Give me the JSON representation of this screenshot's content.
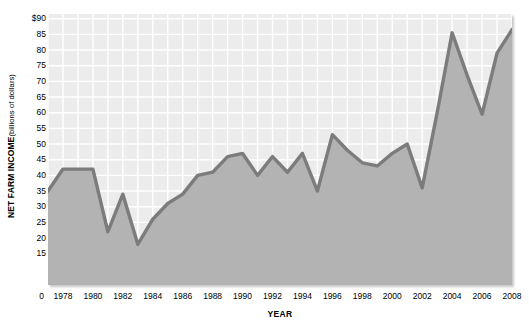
{
  "chart_data": {
    "type": "area",
    "title": "",
    "xlabel": "YEAR",
    "ylabel": "NET FARM INCOME (billions of dollars)",
    "ylabel_main": "NET FARM INCOME",
    "ylabel_sub": "(billions of dollars)",
    "ylim": [
      0,
      90
    ],
    "xlim": [
      1977,
      2008
    ],
    "grid": true,
    "legend": false,
    "legend_position": "none",
    "y_ticks": [
      90,
      85,
      80,
      75,
      70,
      65,
      60,
      55,
      50,
      45,
      40,
      35,
      30,
      25,
      20,
      15
    ],
    "y_tick_labels": [
      "$90",
      "85",
      "80",
      "75",
      "70",
      "65",
      "60",
      "55",
      "50",
      "45",
      "40",
      "35",
      "30",
      "25",
      "20",
      "15"
    ],
    "y_origin_label": "0",
    "x_ticks": [
      1978,
      1980,
      1982,
      1984,
      1986,
      1988,
      1990,
      1992,
      1994,
      1996,
      1998,
      2000,
      2002,
      2004,
      2006,
      2008
    ],
    "x_tick_labels": [
      "1978",
      "1980",
      "1982",
      "1984",
      "1986",
      "1988",
      "1990",
      "1992",
      "1994",
      "1996",
      "1998",
      "2000",
      "2002",
      "2004",
      "2006",
      "2008"
    ],
    "x": [
      1977,
      1978,
      1979,
      1980,
      1981,
      1982,
      1983,
      1984,
      1985,
      1986,
      1987,
      1988,
      1989,
      1990,
      1991,
      1992,
      1993,
      1994,
      1995,
      1996,
      1997,
      1998,
      1999,
      2000,
      2001,
      2002,
      2003,
      2004,
      2005,
      2006,
      2007,
      2008
    ],
    "values": [
      35,
      42,
      42,
      42,
      22,
      34,
      18,
      26,
      31,
      34,
      40,
      41,
      46,
      47,
      40,
      46,
      41,
      47,
      35,
      53,
      48,
      44,
      43,
      47,
      50,
      36,
      60,
      85.5,
      72,
      59.5,
      79,
      86.5
    ],
    "series": [
      {
        "name": "Net farm income",
        "values": [
          35,
          42,
          42,
          42,
          22,
          34,
          18,
          26,
          31,
          34,
          40,
          41,
          46,
          47,
          40,
          46,
          41,
          47,
          35,
          53,
          48,
          44,
          43,
          47,
          50,
          36,
          60,
          85.5,
          72,
          59.5,
          79,
          86.5
        ]
      }
    ],
    "colors": {
      "line": "#7c7c7c",
      "fill": "#b3b3b3",
      "plot_background": "#ececed",
      "gridline": "#ffffff",
      "text": "#000000"
    }
  }
}
